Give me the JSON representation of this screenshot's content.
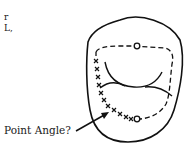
{
  "diagram": {
    "title_fragments": [
      "r",
      "L,"
    ],
    "label": "Point Angle?",
    "colors": {
      "line": "#111111",
      "background": "#ffffff"
    },
    "elements": {
      "outline": "tooth-occlusal-outline",
      "preparation": "dashed-cavity-outline",
      "marks": "x-marks-along-wall",
      "circles": [
        "top-circle",
        "bottom-circle"
      ],
      "arrow": "pointer-arrow"
    }
  }
}
